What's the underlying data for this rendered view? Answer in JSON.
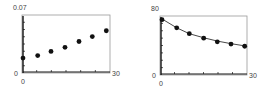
{
  "chart_data": [
    {
      "type": "scatter",
      "title": "",
      "xlabel": "",
      "ylabel": "",
      "xlim": [
        0,
        30
      ],
      "ylim": [
        0,
        0.07
      ],
      "x_tick_labels": {
        "min": "0",
        "max": "30"
      },
      "y_tick_labels": {
        "min": "0",
        "max": "0.07"
      },
      "grid": false,
      "legend": null,
      "series": [
        {
          "name": "data",
          "marker": "dot",
          "x": [
            0,
            5,
            10,
            15,
            20,
            25,
            30
          ],
          "y": [
            0.018,
            0.021,
            0.026,
            0.031,
            0.038,
            0.044,
            0.051
          ]
        }
      ]
    },
    {
      "type": "scatter",
      "title": "",
      "xlabel": "",
      "ylabel": "",
      "xlim": [
        0,
        30
      ],
      "ylim": [
        0,
        80
      ],
      "x_tick_labels": {
        "min": "0",
        "max": "30"
      },
      "y_tick_labels": {
        "min": "0",
        "max": "80"
      },
      "grid": false,
      "legend": null,
      "series": [
        {
          "name": "data",
          "marker": "dot",
          "x": [
            0,
            5,
            10,
            15,
            20,
            25,
            30
          ],
          "y": [
            75,
            64,
            56,
            50,
            45,
            42,
            39
          ]
        },
        {
          "name": "fitted curve",
          "marker": "none",
          "line": "solid",
          "x": [
            0,
            5,
            10,
            15,
            20,
            25,
            30
          ],
          "y": [
            76,
            64,
            56,
            50.5,
            46,
            42.5,
            39.5
          ]
        }
      ]
    }
  ],
  "colors": {
    "ink": "#111111",
    "frame": "#999999",
    "label": "#444444"
  }
}
